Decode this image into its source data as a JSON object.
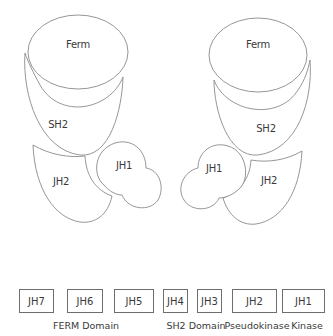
{
  "left_structure": {
    "ferm_label": "Ferm",
    "sh2_label": "SH2",
    "jh2_label": "JH2",
    "jh1_label": "JH1"
  },
  "right_structure": {
    "ferm_label": "Ferm",
    "sh2_label": "SH2",
    "jh2_label": "JH2",
    "jh1_label": "JH1"
  },
  "linear_domains": {
    "boxes": [
      {
        "label": "JH7"
      },
      {
        "label": "JH6"
      },
      {
        "label": "JH5"
      },
      {
        "label": "JH4"
      },
      {
        "label": "JH3"
      },
      {
        "label": "JH2"
      },
      {
        "label": "JH1"
      }
    ],
    "captions": [
      {
        "label": "FERM Domain"
      },
      {
        "label": "SH2 Domain"
      },
      {
        "label": "Pseudokinase"
      },
      {
        "label": "Kinase"
      }
    ]
  },
  "colors": {
    "outline": "#8a8a8a",
    "text": "#3a3a3a",
    "background": "#ffffff"
  }
}
